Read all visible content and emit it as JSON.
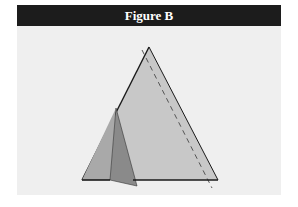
{
  "figure": {
    "title": "Figure B",
    "colors": {
      "header_bg": "#1c1c1c",
      "header_text": "#ffffff",
      "panel_bg": "#efefef",
      "triangle_fill": "#c8c8c8",
      "flap_light": "#a9a9a9",
      "flap_dark": "#8a8a8a",
      "outline": "#1a1a1a",
      "dashed_line": "#555555"
    },
    "shapes": {
      "main_triangle": "equilateral-like triangle with baseline",
      "folded_flap": "left corner folded along a crease",
      "fold_line": "dashed line"
    }
  }
}
